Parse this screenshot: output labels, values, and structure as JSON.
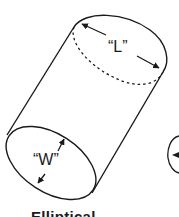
{
  "diagram": {
    "shape": "elliptical cylinder",
    "labels": {
      "length": "“L”",
      "width": "“W”"
    },
    "caption": "Elliptical",
    "colors": {
      "stroke": "#1a1a1a",
      "background": "#ffffff"
    }
  }
}
